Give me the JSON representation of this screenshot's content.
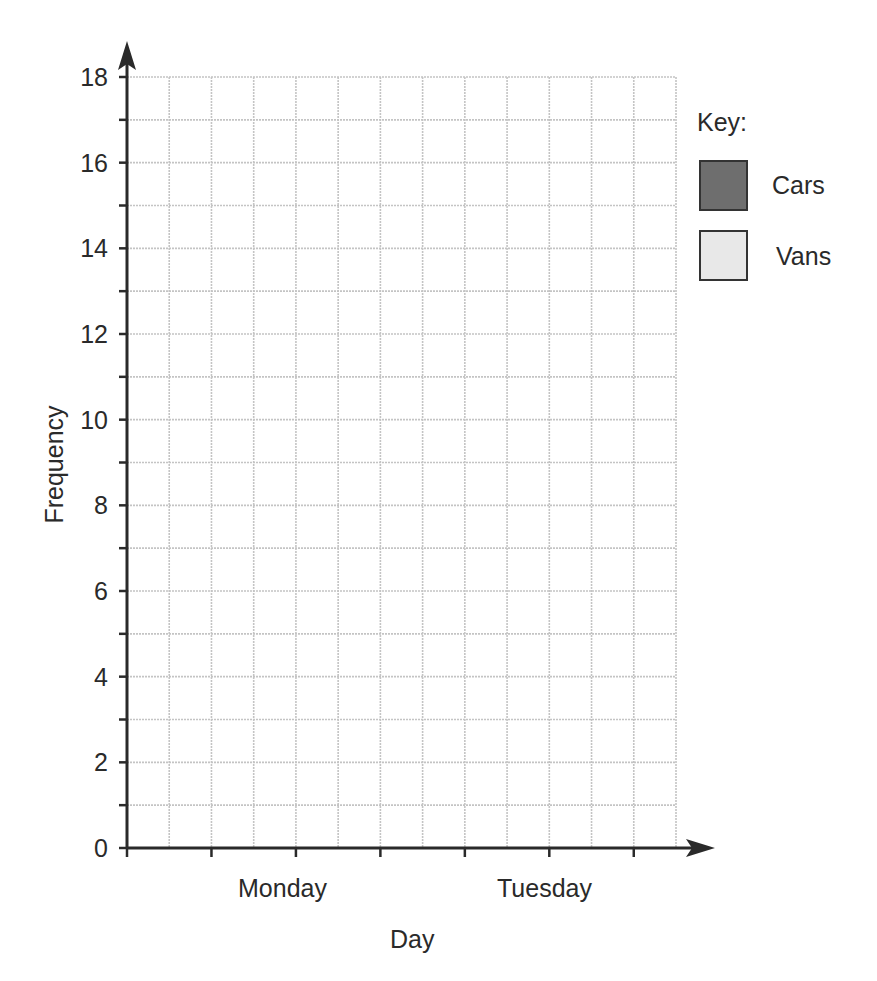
{
  "chart_data": {
    "type": "bar",
    "title": "",
    "xlabel": "Day",
    "ylabel": "Frequency",
    "categories": [
      "Monday",
      "Tuesday"
    ],
    "series": [
      {
        "name": "Cars",
        "color": "#6e6e6e",
        "values": [
          null,
          null
        ]
      },
      {
        "name": "Vans",
        "color": "#e6e6e6",
        "values": [
          null,
          null
        ]
      }
    ],
    "ylim": [
      0,
      18
    ],
    "yticks": [
      0,
      2,
      4,
      6,
      8,
      10,
      12,
      14,
      16,
      18
    ],
    "grid": true,
    "legend": {
      "title": "Key:",
      "position": "right"
    },
    "note": "Blank grouped bar chart grid; no bars drawn"
  },
  "axes": {
    "y_ticks": [
      "0",
      "2",
      "4",
      "6",
      "8",
      "10",
      "12",
      "14",
      "16",
      "18"
    ],
    "x_categories": [
      "Monday",
      "Tuesday"
    ],
    "x_title": "Day",
    "y_title": "Frequency"
  },
  "legend": {
    "title": "Key:",
    "items": [
      {
        "label": "Cars",
        "color": "#6e6e6e"
      },
      {
        "label": "Vans",
        "color": "#e6e6e6"
      }
    ]
  }
}
